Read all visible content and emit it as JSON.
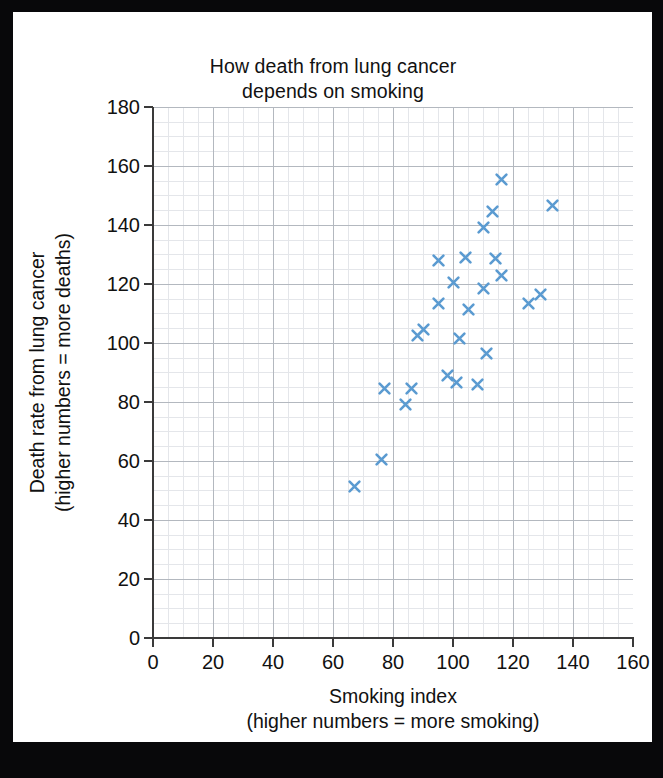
{
  "chart_data": {
    "type": "scatter",
    "title": "How death from lung cancer depends on smoking",
    "title_lines": [
      "How death from lung cancer",
      "depends on smoking"
    ],
    "xlabel": "Smoking index",
    "xlabel_lines": [
      "Smoking index",
      "(higher numbers = more smoking)"
    ],
    "ylabel": "Death rate from lung cancer",
    "ylabel_lines": [
      "Death rate from lung cancer",
      "(higher numbers = more deaths)"
    ],
    "xlim": [
      0,
      160
    ],
    "ylim": [
      0,
      180
    ],
    "xticks": [
      0,
      20,
      40,
      60,
      80,
      100,
      120,
      140,
      160
    ],
    "yticks": [
      0,
      20,
      40,
      60,
      80,
      100,
      120,
      140,
      160,
      180
    ],
    "xtick_labels": [
      "0",
      "20",
      "40",
      "60",
      "80",
      "100",
      "120",
      "140",
      "160"
    ],
    "ytick_labels": [
      "0",
      "20",
      "40",
      "60",
      "80",
      "100",
      "120",
      "140",
      "160",
      "180"
    ],
    "grid": true,
    "grid_major_step_x": 20,
    "grid_major_step_y": 20,
    "grid_minor_step_x": 5,
    "grid_minor_step_y": 5,
    "legend": null,
    "marker": "x",
    "marker_color": "#5b9bd1",
    "points": [
      {
        "x": 67,
        "y": 51.5
      },
      {
        "x": 76,
        "y": 60.5
      },
      {
        "x": 77,
        "y": 84.5
      },
      {
        "x": 84,
        "y": 79
      },
      {
        "x": 86,
        "y": 84.5
      },
      {
        "x": 88,
        "y": 102.5
      },
      {
        "x": 90,
        "y": 104.5
      },
      {
        "x": 95,
        "y": 128
      },
      {
        "x": 95,
        "y": 113.5
      },
      {
        "x": 98,
        "y": 89
      },
      {
        "x": 100,
        "y": 120.5
      },
      {
        "x": 101,
        "y": 86.5
      },
      {
        "x": 102,
        "y": 101.5
      },
      {
        "x": 104,
        "y": 129
      },
      {
        "x": 105,
        "y": 111.5
      },
      {
        "x": 108,
        "y": 86
      },
      {
        "x": 110,
        "y": 139
      },
      {
        "x": 110,
        "y": 118.5
      },
      {
        "x": 111,
        "y": 96.5
      },
      {
        "x": 113,
        "y": 144.5
      },
      {
        "x": 114,
        "y": 128.5
      },
      {
        "x": 116,
        "y": 155.5
      },
      {
        "x": 116,
        "y": 123
      },
      {
        "x": 125,
        "y": 113.5
      },
      {
        "x": 129,
        "y": 116.5
      },
      {
        "x": 133,
        "y": 146.5
      }
    ],
    "point_count": 26,
    "colors": {
      "background": "#ffffff",
      "frame": "#08080a",
      "axis": "#3a3a3a",
      "grid_major": "#9aa0a9",
      "grid_minor": "#cfd3da",
      "text": "#111111",
      "marker": "#5b9bd1"
    }
  }
}
